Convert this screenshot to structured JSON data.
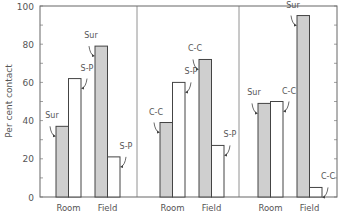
{
  "chart_data": {
    "type": "bar",
    "title": "",
    "ylabel": "Per cent contact",
    "xlabel": "",
    "ylim": [
      0,
      100
    ],
    "yticks": [
      0,
      20,
      40,
      60,
      80,
      100
    ],
    "grid": false,
    "legend": "none (bars annotated with arrows)",
    "panels": [
      {
        "categories": [
          "Room",
          "Field"
        ],
        "series": [
          {
            "name": "Sur",
            "shaded": true,
            "values": [
              37,
              79
            ]
          },
          {
            "name": "S-P",
            "shaded": false,
            "values": [
              62,
              21
            ]
          }
        ]
      },
      {
        "categories": [
          "Room",
          "Field"
        ],
        "series": [
          {
            "name": "C-C",
            "shaded": true,
            "values": [
              39,
              72
            ]
          },
          {
            "name": "S-P",
            "shaded": false,
            "values": [
              60,
              27
            ]
          }
        ]
      },
      {
        "categories": [
          "Room",
          "Field"
        ],
        "series": [
          {
            "name": "Sur",
            "shaded": true,
            "values": [
              49,
              95
            ]
          },
          {
            "name": "C-C",
            "shaded": false,
            "values": [
              50,
              5
            ]
          }
        ]
      }
    ]
  },
  "colors": {
    "shaded_fill": "#cfcfcf",
    "open_fill": "#ffffff",
    "stroke": "#444444",
    "text": "#555555"
  }
}
